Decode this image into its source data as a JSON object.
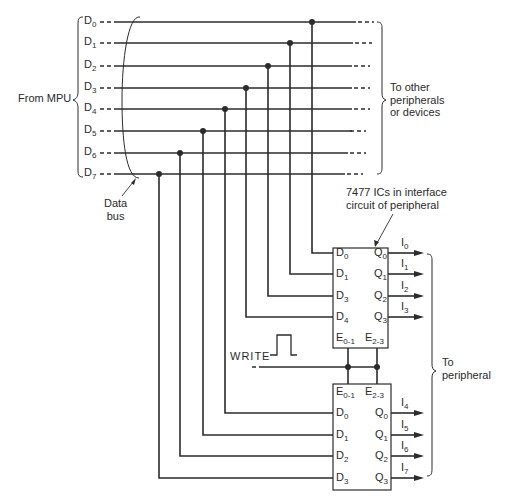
{
  "diagram": {
    "type": "circuit-schematic",
    "colors": {
      "line": "#2b2b2b",
      "background": "#ffffff"
    }
  },
  "labels": {
    "from_mpu": "From MPU",
    "to_other": [
      "To other",
      "peripherals",
      "or devices"
    ],
    "data_bus": [
      "Data",
      "bus"
    ],
    "ic_caption": [
      "7477 ICs in interface",
      "circuit of peripheral"
    ],
    "write": "WRITE",
    "to_peripheral": [
      "To",
      "peripheral"
    ]
  },
  "bus": {
    "lines": [
      {
        "name": "D",
        "sub": "0"
      },
      {
        "name": "D",
        "sub": "1"
      },
      {
        "name": "D",
        "sub": "2"
      },
      {
        "name": "D",
        "sub": "3"
      },
      {
        "name": "D",
        "sub": "4"
      },
      {
        "name": "D",
        "sub": "5"
      },
      {
        "name": "D",
        "sub": "6"
      },
      {
        "name": "D",
        "sub": "7"
      }
    ]
  },
  "ic_upper": {
    "part": "7477",
    "inputs": [
      {
        "name": "D",
        "sub": "0",
        "from_bus": "D0"
      },
      {
        "name": "D",
        "sub": "1",
        "from_bus": "D1"
      },
      {
        "name": "D",
        "sub": "3",
        "from_bus": "D2"
      },
      {
        "name": "D",
        "sub": "4",
        "from_bus": "D3"
      }
    ],
    "outputs": [
      {
        "name": "Q",
        "sub": "0",
        "signal": "I",
        "signal_sub": "0"
      },
      {
        "name": "Q",
        "sub": "1",
        "signal": "I",
        "signal_sub": "1"
      },
      {
        "name": "Q",
        "sub": "2",
        "signal": "I",
        "signal_sub": "2"
      },
      {
        "name": "Q",
        "sub": "3",
        "signal": "I",
        "signal_sub": "3"
      }
    ],
    "enables": [
      {
        "name": "E",
        "sub": "0-1"
      },
      {
        "name": "E",
        "sub": "2-3"
      }
    ]
  },
  "ic_lower": {
    "part": "7477",
    "inputs": [
      {
        "name": "D",
        "sub": "0",
        "from_bus": "D4"
      },
      {
        "name": "D",
        "sub": "1",
        "from_bus": "D5"
      },
      {
        "name": "D",
        "sub": "2",
        "from_bus": "D6"
      },
      {
        "name": "D",
        "sub": "3",
        "from_bus": "D7"
      }
    ],
    "outputs": [
      {
        "name": "Q",
        "sub": "0",
        "signal": "I",
        "signal_sub": "4"
      },
      {
        "name": "Q",
        "sub": "1",
        "signal": "I",
        "signal_sub": "5"
      },
      {
        "name": "Q",
        "sub": "2",
        "signal": "I",
        "signal_sub": "6"
      },
      {
        "name": "Q",
        "sub": "3",
        "signal": "I",
        "signal_sub": "7"
      }
    ],
    "enables": [
      {
        "name": "E",
        "sub": "0-1"
      },
      {
        "name": "E",
        "sub": "2-3"
      }
    ]
  }
}
